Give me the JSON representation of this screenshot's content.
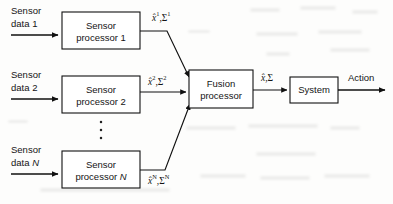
{
  "diagram": {
    "type": "block-diagram",
    "background_color": "#fdfdfc",
    "line_color": "#111111",
    "text_color": "#141414",
    "inputs": [
      {
        "id": "input-1",
        "line1": "Sensor",
        "line2": "data 1",
        "italic_tail": ""
      },
      {
        "id": "input-2",
        "line1": "Sensor",
        "line2": "data 2",
        "italic_tail": ""
      },
      {
        "id": "input-n",
        "line1": "Sensor",
        "line2": "data ",
        "italic_tail": "N"
      }
    ],
    "blocks": [
      {
        "id": "sensor-processor-1",
        "line1": "Sensor",
        "line2": "processor ",
        "index": "1",
        "index_italic": false
      },
      {
        "id": "sensor-processor-2",
        "line1": "Sensor",
        "line2": "processor ",
        "index": "2",
        "index_italic": false
      },
      {
        "id": "sensor-processor-n",
        "line1": "Sensor",
        "line2": "processor ",
        "index": "N",
        "index_italic": true
      },
      {
        "id": "fusion-processor",
        "line1": "Fusion",
        "line2": "processor",
        "index": "",
        "index_italic": false
      },
      {
        "id": "system",
        "line1": "System",
        "line2": "",
        "index": "",
        "index_italic": false
      }
    ],
    "signals": [
      {
        "id": "signal-1",
        "base": "x̂",
        "sup": "1",
        "sep": ",",
        "base2": "Σ",
        "sup2": "1"
      },
      {
        "id": "signal-2",
        "base": "x̂",
        "sup": "2",
        "sep": ",",
        "base2": "Σ",
        "sup2": "2"
      },
      {
        "id": "signal-n",
        "base": "x̂",
        "sup": "N",
        "sep": ",",
        "base2": "Σ",
        "sup2": "N"
      },
      {
        "id": "signal-fused",
        "base": "x̂",
        "sup": "",
        "sep": ",",
        "base2": "Σ",
        "sup2": ""
      }
    ],
    "output": {
      "id": "output-action",
      "label": "Action"
    },
    "ellipsis": {
      "id": "vertical-ellipsis",
      "glyph": "⋮",
      "count": 3
    }
  }
}
